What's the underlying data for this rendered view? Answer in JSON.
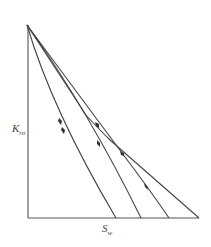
{
  "diagram": {
    "type": "relative-permeability-paths",
    "axes": {
      "y_label": "K",
      "y_label_sub": "ro",
      "x_label": "S",
      "x_label_sub": "w"
    },
    "curves": [
      {
        "name": "path-1",
        "end_x_label": ""
      },
      {
        "name": "path-2",
        "end_x_label": ""
      },
      {
        "name": "path-3",
        "end_x_label": ""
      },
      {
        "name": "path-4-outer",
        "end_x_label": ""
      }
    ],
    "colors": {
      "line": "#444444",
      "axis": "#555555",
      "background": "#ffffff"
    }
  }
}
